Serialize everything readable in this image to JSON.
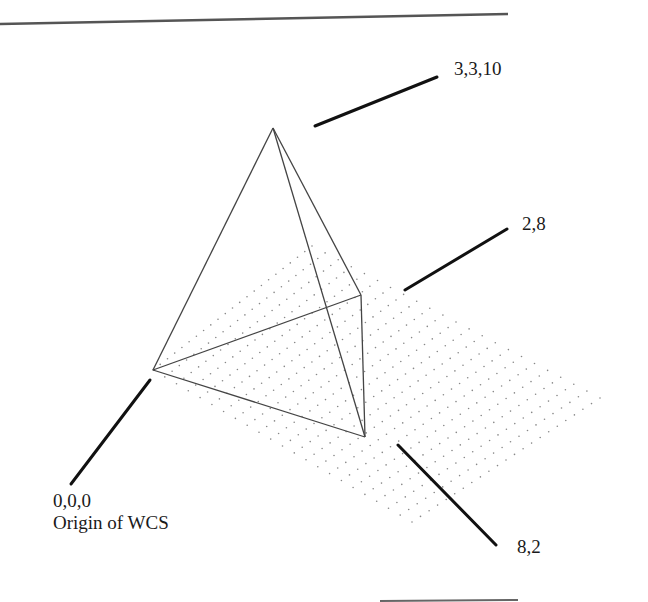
{
  "figure": {
    "labels": {
      "apex": "3,3,10",
      "corner_far": "2,8",
      "corner_near": "8,2",
      "origin_coords": "0,0,0",
      "origin_text": "Origin of WCS"
    },
    "colors": {
      "rule": "#555555",
      "edge": "#444444",
      "leader": "#111111",
      "grid_dot": "#888888",
      "text": "#1a1a1a"
    },
    "vertices": {
      "apex": [
        273,
        128
      ],
      "origin": [
        153,
        370
      ],
      "far_corner": [
        361,
        295
      ],
      "near_corner": [
        365,
        437
      ]
    },
    "grid": {
      "corners": [
        [
          153,
          370
        ],
        [
          312,
          246
        ],
        [
          600,
          398
        ],
        [
          412,
          522
        ]
      ],
      "rows": 22,
      "cols": 22
    }
  }
}
